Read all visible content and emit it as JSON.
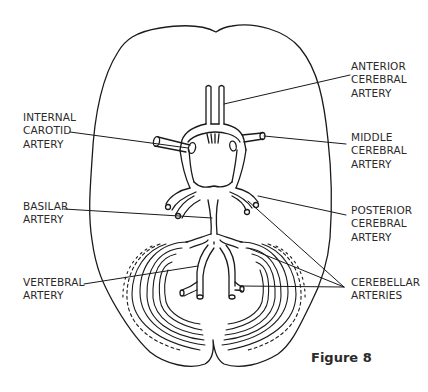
{
  "figure": {
    "caption": "Figure 8"
  },
  "labels": {
    "anterior_cerebral": {
      "lines": [
        "ANTERIOR",
        "CEREBRAL",
        "ARTERY"
      ]
    },
    "internal_carotid": {
      "lines": [
        "INTERNAL",
        "CAROTID",
        "ARTERY"
      ]
    },
    "middle_cerebral": {
      "lines": [
        "MIDDLE",
        "CEREBRAL",
        "ARTERY"
      ]
    },
    "basilar": {
      "lines": [
        "BASILAR",
        "ARTERY"
      ]
    },
    "posterior_cerebral": {
      "lines": [
        "POSTERIOR",
        "CEREBRAL",
        "ARTERY"
      ]
    },
    "vertebral": {
      "lines": [
        "VERTEBRAL",
        "ARTERY"
      ]
    },
    "cerebellar": {
      "lines": [
        "CEREBELLAR",
        "ARTERIES"
      ]
    }
  },
  "colors": {
    "line": "#1a1a1a",
    "text": "#2a2a2a",
    "background": "#ffffff"
  }
}
